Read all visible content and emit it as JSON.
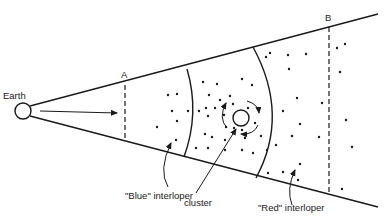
{
  "diagram": {
    "labels": {
      "earth": "Earth",
      "a": "A",
      "b": "B",
      "blue_interloper": "\"Blue\" interloper",
      "cluster": "cluster",
      "red_interloper": "\"Red\" interloper"
    },
    "colors": {
      "ink": "#1a1a1a",
      "background": "#ffffff"
    }
  }
}
